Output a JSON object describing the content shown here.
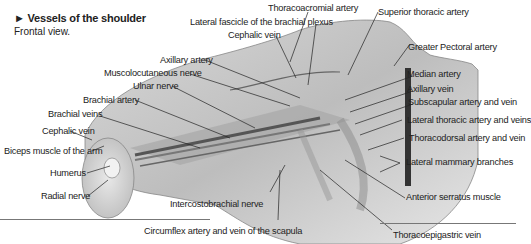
{
  "header": {
    "title": "► Vessels of the shoulder",
    "subtitle": "Frontal view."
  },
  "labels": {
    "thoracoacromial_artery": "Thoracoacromial artery",
    "superior_thoracic_artery": "Superior thoracic artery",
    "lateral_fascicle": "Lateral fascicle of the brachial plexus",
    "cephalic_vein_top": "Cephalic vein",
    "greater_pectoral_artery": "Greater Pectoral artery",
    "axillary_artery": "Axillary artery",
    "musculocutaneous_nerve": "Muscolocutaneous nerve",
    "ulnar_nerve": "Ulnar nerve",
    "brachial_artery": "Brachial artery",
    "brachial_veins": "Brachial veins",
    "cephalic_vein_left": "Cephalic vein",
    "biceps_muscle": "Biceps muscle of the arm",
    "humerus": "Humerus",
    "radial_nerve": "Radial nerve",
    "median_artery": "Median artery",
    "axillary_vein": "Axillary vein",
    "subscapular": "Subscapular artery and vein",
    "lateral_thoracic": "Lateral thoracic artery and veins",
    "thoracodorsal": "Thoracodorsal artery and vein",
    "lateral_mammary": "Lateral mammary branches",
    "anterior_serratus": "Anterior serratus muscle",
    "intercostobrachial_nerve": "Intercostobrachial nerve",
    "circumflex": "Circumflex artery and vein of the scapula",
    "thoracoepigastric_vein": "Thoracoepigastric vein"
  }
}
